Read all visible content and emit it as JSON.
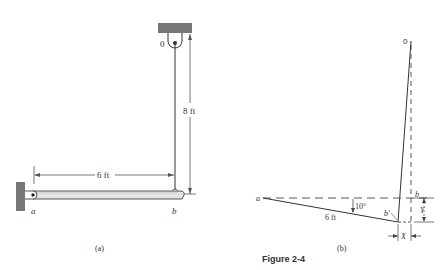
{
  "figure": {
    "caption": "Figure 2-4",
    "panel_a": {
      "label": "(a)",
      "pulley_label": "0",
      "point_a_label": "a",
      "point_b_label": "b",
      "bar_length_label": "6 ft",
      "rope_length_label": "8 ft"
    },
    "panel_b": {
      "label": "(b)",
      "top_label": "0",
      "point_a_label": "a",
      "point_b_label": "b",
      "point_b_prime_label": "b'",
      "angle_label": "10°",
      "length_label": "6 ft",
      "dx_label": "X",
      "dy_label": "Y"
    }
  },
  "colors": {
    "ink": "#333333",
    "wall_fill": "#777777",
    "bar_fill": "#e4e4e4"
  }
}
